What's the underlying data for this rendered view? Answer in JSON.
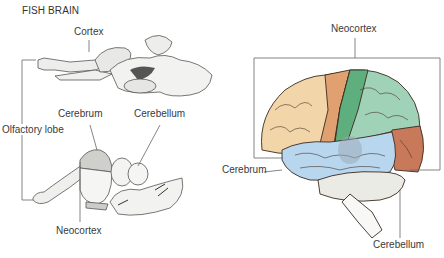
{
  "figure": {
    "left_panel": {
      "title": "FISH BRAIN",
      "labels": {
        "cortex": "Cortex",
        "cerebrum": "Cerebrum",
        "cerebellum": "Cerebellum",
        "olfactory_lobe": "Olfactory lobe",
        "neocortex": "Neocortex"
      }
    },
    "right_panel": {
      "labels": {
        "neocortex": "Neocortex",
        "cerebrum": "Cerebrum",
        "cerebellum": "Cerebellum"
      },
      "lobe_colors": {
        "frontal": "#f2d5a8",
        "motor_strip": "#e0a070",
        "parietal_front": "#5fae7e",
        "parietal": "#9fd2b6",
        "occipital": "#c7795a",
        "temporal": "#b8d6ee",
        "cerebellum": "#e8e8e0"
      }
    }
  }
}
